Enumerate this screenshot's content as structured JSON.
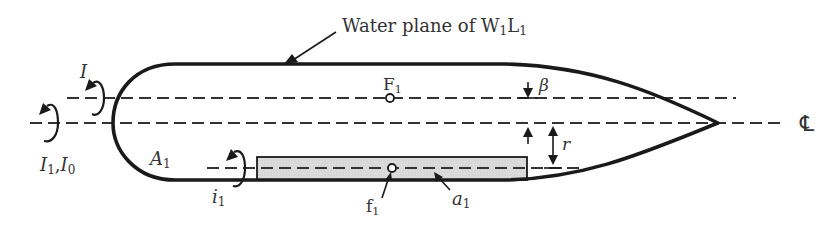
{
  "figure": {
    "title_label": "Water plane of W",
    "title_sub1": "1",
    "title_mid": "L",
    "title_sub2": "1",
    "labels": {
      "I": "I",
      "I1_main": "I",
      "I1_sub": "1",
      "I0_sep": ",",
      "I0_main": "I",
      "I0_sub": "0",
      "A1_main": "A",
      "A1_sub": "1",
      "F1_main": "F",
      "F1_sub": "1",
      "beta": "β",
      "r": "r",
      "i1_main": "i",
      "i1_sub": "1",
      "f1_main": "f",
      "f1_sub": "1",
      "a1_main": "a",
      "a1_sub": "1",
      "centerline": "℄"
    },
    "colors": {
      "line": "#1a1a1a",
      "shaded_area": "#d9d9d9",
      "text": "#333333"
    }
  }
}
